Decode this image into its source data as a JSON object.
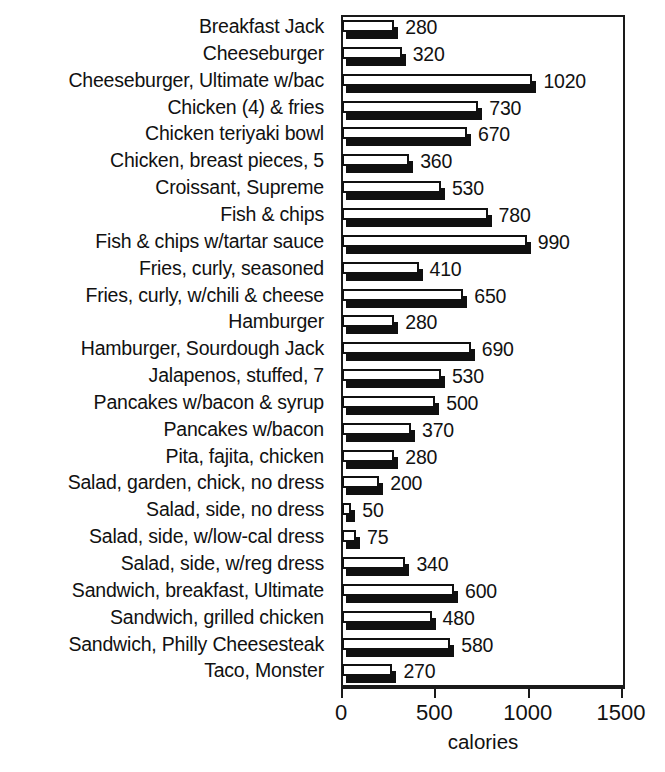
{
  "chart_data": {
    "type": "bar",
    "orientation": "horizontal",
    "title": "",
    "xlabel": "calories",
    "ylabel": "",
    "xlim": [
      0,
      1500
    ],
    "xticks": [
      0,
      500,
      1000,
      1500
    ],
    "xtick_labels": [
      "0",
      "500",
      "1000",
      "1500"
    ],
    "grid": false,
    "legend": null,
    "show_value_labels": true,
    "categories": [
      "Breakfast Jack",
      "Cheeseburger",
      "Cheeseburger, Ultimate w/bac",
      "Chicken (4) & fries",
      "Chicken teriyaki bowl",
      "Chicken, breast pieces, 5",
      "Croissant, Supreme",
      "Fish & chips",
      "Fish & chips w/tartar sauce",
      "Fries, curly, seasoned",
      "Fries, curly, w/chili & cheese",
      "Hamburger",
      "Hamburger, Sourdough Jack",
      "Jalapenos, stuffed, 7",
      "Pancakes w/bacon & syrup",
      "Pancakes w/bacon",
      "Pita, fajita, chicken",
      "Salad, garden, chick, no dress",
      "Salad, side, no dress",
      "Salad, side, w/low-cal dress",
      "Salad, side, w/reg dress",
      "Sandwich, breakfast, Ultimate",
      "Sandwich, grilled chicken",
      "Sandwich, Philly Cheesesteak",
      "Taco, Monster"
    ],
    "values": [
      280,
      320,
      1020,
      730,
      670,
      360,
      530,
      780,
      990,
      410,
      650,
      280,
      690,
      530,
      500,
      370,
      280,
      200,
      50,
      75,
      340,
      600,
      480,
      580,
      270
    ],
    "value_labels": [
      "280",
      "320",
      "1020",
      "730",
      "670",
      "360",
      "530",
      "780",
      "990",
      "410",
      "650",
      "280",
      "690",
      "530",
      "500",
      "370",
      "280",
      "200",
      "50",
      "75",
      "340",
      "600",
      "480",
      "580",
      "270"
    ]
  },
  "style": {
    "bar_face_color": "#ffffff",
    "bar_edge_color": "#101010",
    "bar_shadow_color": "#101010",
    "axis_color": "#1a1a1a",
    "text_color": "#111111",
    "background_color": "#ffffff"
  }
}
